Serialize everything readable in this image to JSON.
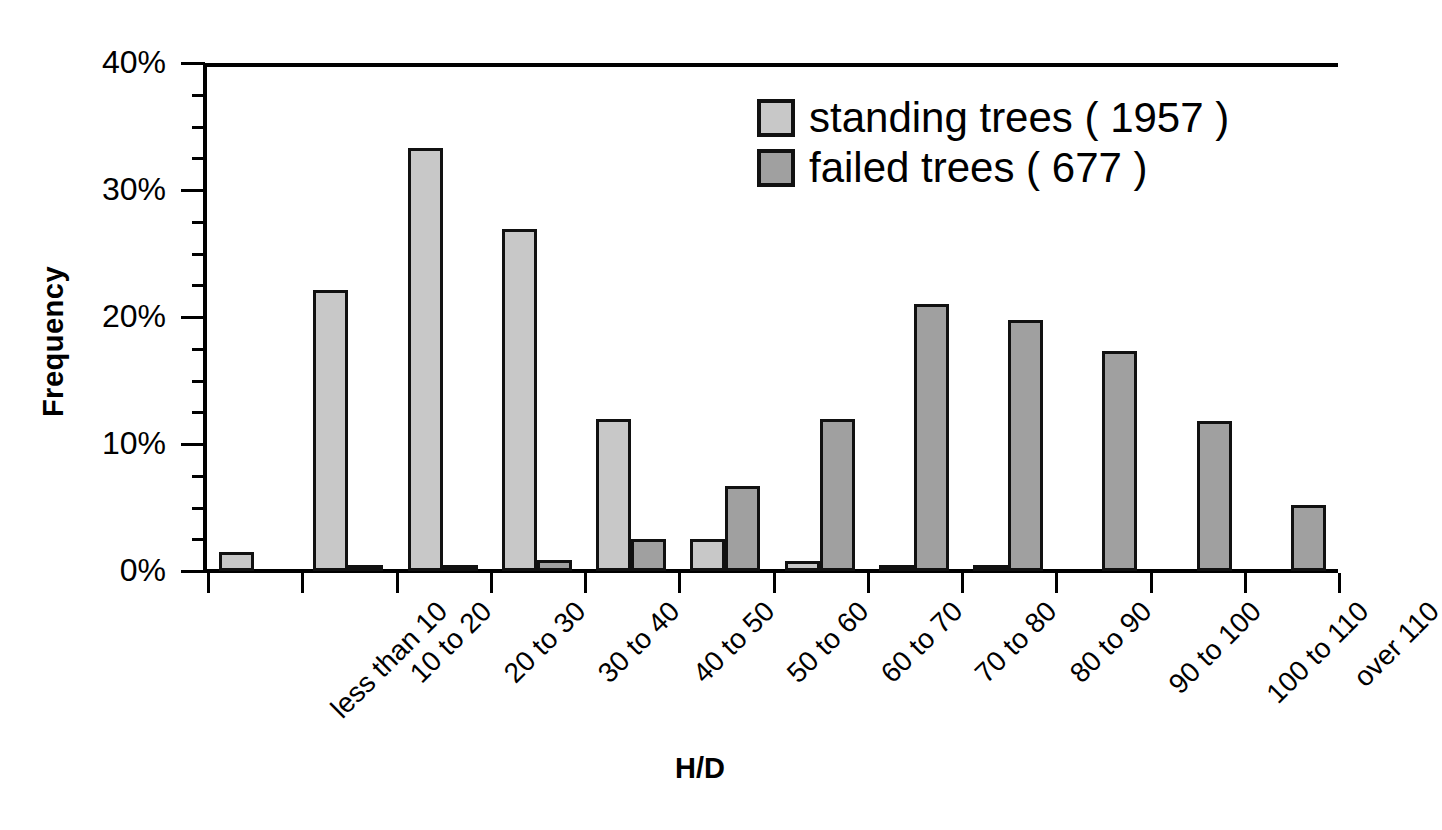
{
  "axes": {
    "ylabel": "Frequency",
    "xlabel": "H/D",
    "yticks": [
      "0%",
      "10%",
      "20%",
      "30%",
      "40%"
    ]
  },
  "legend": {
    "items": [
      {
        "label": "standing trees ( 1957 )",
        "color": "#c8c8c8",
        "series": "standing"
      },
      {
        "label": "failed trees ( 677 )",
        "color": "#a0a0a0",
        "series": "failed"
      }
    ]
  },
  "chart_data": {
    "type": "bar",
    "title": "",
    "xlabel": "H/D",
    "ylabel": "Frequency",
    "ylim": [
      0,
      40
    ],
    "yunit": "%",
    "ytick_values": [
      0,
      10,
      20,
      30,
      40
    ],
    "ytick_labels": [
      "0%",
      "10%",
      "20%",
      "30%",
      "40%"
    ],
    "minor_tick_step": 2.5,
    "grid": false,
    "legend_position": "top-right",
    "categories": [
      "less than 10",
      "10 to 20",
      "20 to 30",
      "30 to 40",
      "40 to 50",
      "50 to 60",
      "60 to 70",
      "70 to 80",
      "80 to 90",
      "90 to 100",
      "100 to 110",
      "over 110"
    ],
    "series": [
      {
        "name": "standing trees ( 1957 )",
        "color": "#c8c8c8",
        "values": [
          1.5,
          22.1,
          33.3,
          26.9,
          12.0,
          2.5,
          0.8,
          0.15,
          0.1,
          0.0,
          0.0,
          0.0
        ]
      },
      {
        "name": "failed trees ( 677 )",
        "color": "#a0a0a0",
        "values": [
          0.0,
          0.2,
          0.4,
          0.9,
          2.5,
          6.7,
          12.0,
          21.0,
          19.8,
          17.3,
          11.8,
          5.2
        ]
      }
    ]
  }
}
